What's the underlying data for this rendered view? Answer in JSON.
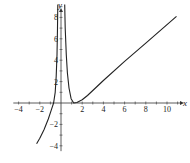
{
  "chart_data": {
    "type": "line",
    "title": "",
    "xlabel": "x",
    "ylabel": "y",
    "xlim": [
      -4.5,
      11.3
    ],
    "ylim": [
      -4.5,
      9.6
    ],
    "grid": false,
    "legend": null,
    "x_tick_labels": [
      "-4",
      "-2",
      "2",
      "4",
      "6",
      "8",
      "10"
    ],
    "y_tick_labels": [
      "-4",
      "-2",
      "2",
      "4",
      "6",
      "8"
    ],
    "asymptote_x": 0,
    "series": [
      {
        "name": "left branch",
        "x": [
          -2.3,
          -2.0,
          -1.6,
          -1.2,
          -0.9,
          -0.7,
          -0.55,
          -0.45,
          -0.38,
          -0.33,
          -0.3
        ],
        "y": [
          -3.8,
          -3.3,
          -2.5,
          -1.5,
          -0.6,
          0.0,
          1.0,
          2.5,
          4.5,
          7.0,
          9.2
        ]
      },
      {
        "name": "right branch",
        "x": [
          0.35,
          0.4,
          0.5,
          0.6,
          0.75,
          0.95,
          1.2,
          1.5,
          2.0,
          2.5,
          4.0,
          6.0,
          8.0,
          10.9
        ],
        "y": [
          9.2,
          7.0,
          4.5,
          2.8,
          1.4,
          0.4,
          0.0,
          0.05,
          0.3,
          0.7,
          2.1,
          3.9,
          5.6,
          8.1
        ]
      }
    ]
  },
  "labels": {
    "x_axis": "x",
    "y_axis": "y"
  }
}
